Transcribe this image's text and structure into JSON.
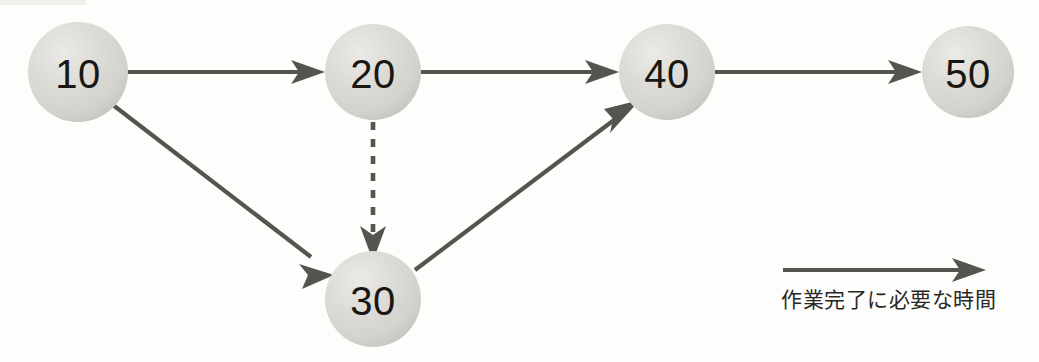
{
  "diagram": {
    "background_color": "#fdfdfc",
    "node_fill_color": "#d9d8d3",
    "node_text_color": "#191713",
    "edge_color": "#55544f",
    "nodes": [
      {
        "id": "n10",
        "label": "10",
        "cx": 78,
        "cy": 72,
        "r": 50
      },
      {
        "id": "n20",
        "label": "20",
        "cx": 373,
        "cy": 72,
        "r": 48
      },
      {
        "id": "n40",
        "label": "40",
        "cx": 667,
        "cy": 72,
        "r": 48
      },
      {
        "id": "n50",
        "label": "50",
        "cx": 968,
        "cy": 72,
        "r": 46
      },
      {
        "id": "n30",
        "label": "30",
        "cx": 373,
        "cy": 299,
        "r": 48
      }
    ],
    "edges": [
      {
        "id": "e10-20",
        "from": "10",
        "to": "20",
        "style": "solid",
        "arrow": true
      },
      {
        "id": "e20-40",
        "from": "20",
        "to": "40",
        "style": "solid",
        "arrow": true
      },
      {
        "id": "e40-50",
        "from": "40",
        "to": "50",
        "style": "solid",
        "arrow": true
      },
      {
        "id": "e10-30",
        "from": "10",
        "to": "30",
        "style": "solid",
        "arrow": true
      },
      {
        "id": "e20-30",
        "from": "20",
        "to": "30",
        "style": "dashed",
        "arrow": true
      },
      {
        "id": "e30-40",
        "from": "30",
        "to": "40",
        "style": "solid",
        "arrow": true
      }
    ]
  },
  "legend": {
    "arrow_icon": "right-arrow-icon",
    "caption": "作業完了に必要な時間"
  }
}
